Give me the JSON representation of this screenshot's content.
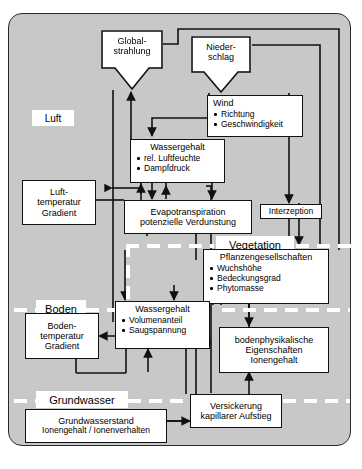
{
  "diagram": {
    "panel_color": "#c8c8c8",
    "box_fill": "#ffffff",
    "line_color": "#111111"
  },
  "zones": [
    {
      "id": "luft",
      "label": "Luft"
    },
    {
      "id": "vegetation",
      "label": "Vegetation"
    },
    {
      "id": "boden",
      "label": "Boden"
    },
    {
      "id": "grundwasser",
      "label": "Grundwasser"
    }
  ],
  "nodes": {
    "globalstrahlung": {
      "lines": [
        "Global-",
        "strahlung"
      ],
      "shape": "arrow-down"
    },
    "niederschlag": {
      "lines": [
        "Nieder-",
        "schlag"
      ],
      "shape": "arrow-down"
    },
    "wind": {
      "title": "Wind",
      "bullets": [
        "Richtung",
        "Geschwindigkeit"
      ]
    },
    "wassergehalt_luft": {
      "title": "Wassergehalt",
      "bullets": [
        "rel. Luftfeuchte",
        "Dampfdruck"
      ]
    },
    "lufttemperatur": {
      "lines": [
        "Luft-",
        "temperatur",
        "Gradient"
      ]
    },
    "evapotranspiration": {
      "lines": [
        "Evapotranspiration",
        "potenzielle Verdunstung"
      ]
    },
    "interzeption": {
      "lines": [
        "Interzeption"
      ]
    },
    "pflanzengesellschaften": {
      "title": "Pflanzengesellschaften",
      "bullets": [
        "Wuchshöhe",
        "Bedeckungsgrad",
        "Phytomasse"
      ]
    },
    "wassergehalt_boden": {
      "title": "Wassergehalt",
      "bullets": [
        "Volumenanteil",
        "Saugspannung"
      ]
    },
    "bodentemperatur": {
      "lines": [
        "Boden-",
        "temperatur",
        "Gradient"
      ]
    },
    "bodenphysikalische": {
      "lines": [
        "bodenphysikalische",
        "Eigenschaften",
        "Ionengehalt"
      ]
    },
    "versickerung": {
      "lines": [
        "Versickerung",
        "kapillarer Aufstieg"
      ]
    },
    "grundwasserstand": {
      "lines": [
        "Grundwasserstand",
        "Ionengehalt / Ionenverhalten"
      ]
    }
  }
}
